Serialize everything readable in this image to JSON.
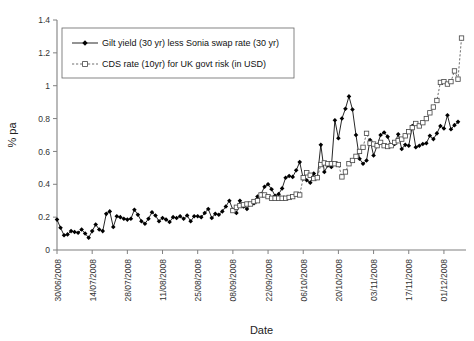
{
  "chart_data": {
    "type": "line",
    "title": "",
    "xlabel": "Date",
    "ylabel": "% pa",
    "ylim": [
      0,
      1.4
    ],
    "yticks": [
      0,
      0.2,
      0.4,
      0.6,
      0.8,
      1,
      1.2,
      1.4
    ],
    "ytick_labels": [
      "0",
      "0.2",
      "0.4",
      "0.6",
      "0.8",
      "1",
      "1.2",
      "1.4"
    ],
    "grid": false,
    "legend_position": "top-left",
    "xtick_labels": [
      "30/06/2008",
      "14/07/2008",
      "28/07/2008",
      "11/08/2008",
      "25/08/2008",
      "08/09/2008",
      "22/09/2008",
      "06/10/2008",
      "20/10/2008",
      "03/11/2008",
      "17/11/2008",
      "01/12/2008"
    ],
    "xtick_indices": [
      0,
      10,
      20,
      30,
      40,
      50,
      60,
      70,
      80,
      90,
      100,
      110
    ],
    "n_points": 115,
    "series": [
      {
        "name": "Gilt yield (30 yr) less Sonia swap rate (30 yr)",
        "marker": "filled-diamond",
        "line_style": "solid",
        "color": "#000000",
        "values": [
          0.185,
          0.135,
          0.09,
          0.095,
          0.115,
          0.11,
          0.105,
          0.125,
          0.1,
          0.075,
          0.115,
          0.155,
          0.125,
          0.115,
          0.22,
          0.235,
          0.14,
          0.205,
          0.2,
          0.19,
          0.185,
          0.19,
          0.245,
          0.215,
          0.175,
          0.16,
          0.19,
          0.23,
          0.21,
          0.175,
          0.195,
          0.185,
          0.17,
          0.2,
          0.195,
          0.205,
          0.19,
          0.21,
          0.175,
          0.205,
          0.205,
          0.2,
          0.225,
          0.25,
          0.195,
          0.22,
          0.215,
          0.235,
          0.265,
          0.3,
          0.245,
          0.225,
          0.3,
          0.265,
          0.25,
          0.28,
          0.285,
          0.325,
          0.34,
          0.385,
          0.4,
          0.37,
          0.33,
          0.34,
          0.375,
          0.44,
          0.45,
          0.445,
          0.485,
          0.535,
          0.435,
          0.425,
          0.41,
          0.465,
          0.44,
          0.64,
          0.475,
          0.515,
          0.505,
          0.79,
          0.68,
          0.8,
          0.86,
          0.935,
          0.855,
          0.7,
          0.555,
          0.525,
          0.545,
          0.67,
          0.575,
          0.635,
          0.7,
          0.715,
          0.69,
          0.635,
          0.645,
          0.705,
          0.615,
          0.64,
          0.635,
          0.755,
          0.625,
          0.635,
          0.645,
          0.65,
          0.695,
          0.675,
          0.71,
          0.755,
          0.74,
          0.82,
          0.735,
          0.76,
          0.78
        ]
      },
      {
        "name": "CDS rate (10yr) for UK govt risk (in USD)",
        "marker": "open-square",
        "line_style": "dashed",
        "color": "#555555",
        "start_index": 50,
        "values": [
          0.24,
          0.26,
          0.27,
          0.275,
          0.28,
          0.28,
          0.295,
          0.3,
          0.335,
          0.335,
          0.325,
          0.315,
          0.315,
          0.315,
          0.315,
          0.315,
          0.32,
          0.325,
          0.34,
          0.335,
          0.44,
          0.47,
          0.455,
          0.435,
          0.44,
          0.52,
          0.53,
          0.525,
          0.525,
          0.525,
          0.52,
          0.445,
          0.475,
          0.525,
          0.545,
          0.57,
          0.6,
          0.625,
          0.71,
          0.65,
          0.645,
          0.635,
          0.655,
          0.635,
          0.63,
          0.635,
          0.655,
          0.665,
          0.675,
          0.695,
          0.72,
          0.745,
          0.77,
          0.755,
          0.775,
          0.8,
          0.835,
          0.87,
          0.91,
          1.02,
          1.025,
          1.01,
          1.025,
          1.09,
          1.04,
          1.29
        ]
      }
    ]
  },
  "legend": {
    "entries": [
      {
        "label": "Gilt yield (30 yr) less Sonia swap rate (30 yr)"
      },
      {
        "label": "CDS rate (10yr) for UK govt risk (in USD)"
      }
    ]
  }
}
